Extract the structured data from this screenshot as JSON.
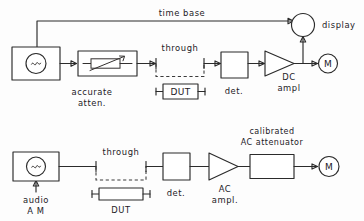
{
  "figure": {
    "title": "",
    "style": "hand-drawn block diagram",
    "ink_color": "#2b2b2b",
    "background_color": "#fdfdfd"
  },
  "top_setup": {
    "name": "DC substitution attenuation measurement",
    "labels": {
      "time_base": "time base",
      "display": "display",
      "through": "through",
      "dut": "DUT",
      "accurate_atten_line1": "accurate",
      "accurate_atten_line2": "atten.",
      "detector": "det.",
      "dc_ampl_line1": "DC",
      "dc_ampl_line2": "ampl",
      "meter": "M",
      "source_symbol": "~"
    }
  },
  "bottom_setup": {
    "name": "AC substitution attenuation measurement",
    "labels": {
      "through": "through",
      "dut": "DUT",
      "audio_am_line1": "audio",
      "audio_am_line2": "A M",
      "detector": "det.",
      "ac_ampl_line1": "AC",
      "ac_ampl_line2": "ampl.",
      "calibrated_line1": "calibrated",
      "calibrated_line2": "AC  attenuator",
      "meter": "M",
      "source_symbol": "~"
    }
  }
}
